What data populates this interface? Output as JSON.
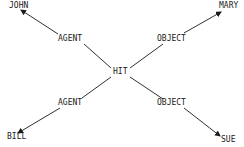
{
  "diagram": {
    "type": "semantic-network",
    "center": {
      "label": "HIT"
    },
    "nodes": [
      {
        "id": "john",
        "label": "JOHN"
      },
      {
        "id": "mary",
        "label": "MARY"
      },
      {
        "id": "bill",
        "label": "BILL"
      },
      {
        "id": "sue",
        "label": "SUE"
      }
    ],
    "edges": [
      {
        "from": "HIT",
        "to": "JOHN",
        "label": "AGENT"
      },
      {
        "from": "HIT",
        "to": "MARY",
        "label": "OBJECT"
      },
      {
        "from": "HIT",
        "to": "BILL",
        "label": "AGENT"
      },
      {
        "from": "HIT",
        "to": "SUE",
        "label": "OBJECT"
      }
    ],
    "colors": {
      "ink": "#1a1a1a",
      "background": "#ffffff"
    }
  }
}
